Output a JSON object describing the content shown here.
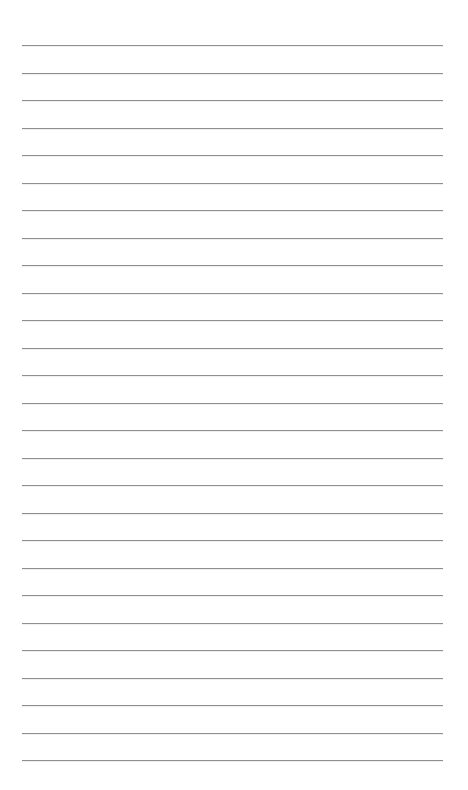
{
  "page": {
    "type": "lined-paper",
    "background_color": "#ffffff",
    "line_color": "#8f8f8f",
    "line_count": 27,
    "first_line_y": 45,
    "line_spacing": 27.5,
    "line_left": 22,
    "line_width": 421
  }
}
